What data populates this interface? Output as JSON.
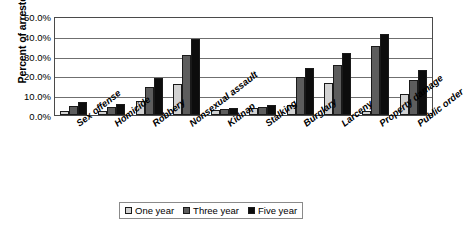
{
  "chart_data": {
    "type": "bar",
    "title": "",
    "xlabel": "",
    "ylabel": "Percent of arrestees",
    "ylim": [
      0,
      50
    ],
    "ytick_labels": [
      "50.0%",
      "40.0%",
      "30.0%",
      "20.0%",
      "10.0%",
      "0.0%"
    ],
    "ytick_values": [
      50,
      40,
      30,
      20,
      10,
      0
    ],
    "grid": true,
    "legend_position": "bottom",
    "categories": [
      "Sex offense",
      "Homicide",
      "Robbery",
      "Nonsexual assault",
      "Kidnap",
      "Stalking",
      "Burglary",
      "Larceny",
      "Property damage",
      "Public order"
    ],
    "series": [
      {
        "name": "One year",
        "color": "#d2d2d2",
        "values": [
          1.8,
          1.9,
          6.9,
          15.9,
          2.5,
          3.6,
          5.1,
          16.0,
          2.1,
          10.8
        ]
      },
      {
        "name": "Three year",
        "color": "#5d5d5d",
        "values": [
          4.5,
          3.9,
          14.4,
          30.5,
          2.9,
          4.2,
          19.0,
          25.4,
          34.8,
          17.6
        ]
      },
      {
        "name": "Five year",
        "color": "#0d0d0d",
        "values": [
          6.4,
          5.6,
          18.5,
          38.4,
          3.3,
          4.9,
          23.8,
          31.3,
          41.0,
          22.6
        ]
      }
    ]
  }
}
